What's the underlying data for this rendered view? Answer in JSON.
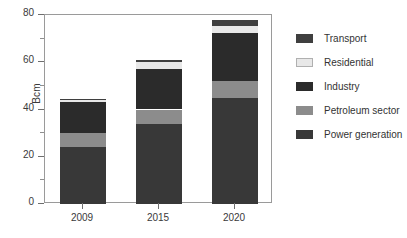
{
  "chart_data": {
    "type": "bar",
    "subtype": "stacked-vertical",
    "title": "",
    "xlabel": "",
    "ylabel": "Bcm",
    "categories": [
      "2009",
      "2015",
      "2020"
    ],
    "ylim": [
      0,
      80
    ],
    "yticks": [
      0,
      20,
      40,
      60,
      80
    ],
    "ytick_labels": [
      "0",
      "20",
      "40",
      "60",
      "80"
    ],
    "yticks_minor": [
      10,
      30,
      50,
      70
    ],
    "grid": false,
    "legend_position": "right",
    "series": [
      {
        "name": "Transport",
        "color": "#3f3f3f",
        "values": [
          0.5,
          1.0,
          2.5
        ]
      },
      {
        "name": "Residential",
        "color": "#e8e8e8",
        "values": [
          1.0,
          3.0,
          3.0
        ]
      },
      {
        "name": "Industry",
        "color": "#2b2b2b",
        "values": [
          13.0,
          17.0,
          20.5
        ]
      },
      {
        "name": "Petroleum sector",
        "color": "#8c8c8c",
        "values": [
          6.0,
          6.0,
          7.0
        ]
      },
      {
        "name": "Power generation",
        "color": "#383838",
        "values": [
          24.0,
          34.0,
          45.0
        ]
      }
    ],
    "stack_order_bottom_to_top": [
      "Power generation",
      "Petroleum sector",
      "Industry",
      "Residential",
      "Transport"
    ],
    "totals": [
      44.5,
      61.0,
      78.0
    ]
  },
  "legend": {
    "items": [
      {
        "label": "Transport",
        "color": "#3f3f3f"
      },
      {
        "label": "Residential",
        "color": "#e8e8e8"
      },
      {
        "label": "Industry",
        "color": "#2b2b2b"
      },
      {
        "label": "Petroleum sector",
        "color": "#8c8c8c"
      },
      {
        "label": "Power generation",
        "color": "#383838"
      }
    ]
  },
  "axis": {
    "y_title": "Bcm"
  }
}
